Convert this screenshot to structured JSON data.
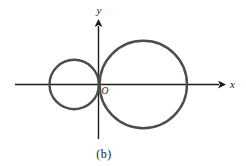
{
  "figure": {
    "caption": "(b)",
    "labels": {
      "x_axis": "x",
      "y_axis": "y",
      "origin": "O"
    },
    "colors": {
      "background": "#ffffff",
      "axis": "#1c1c1c",
      "circle_stroke": "#4d4d4d",
      "text": "#1c1c1c"
    },
    "geometry": {
      "x_axis": {
        "x1": 15,
        "y1": 84.5,
        "x2": 219,
        "y2": 84.5
      },
      "y_axis": {
        "x1": 98.5,
        "y1": 139,
        "x2": 98.5,
        "y2": 26
      },
      "axis_stroke_width": 1.4,
      "circle_stroke_width": 2.4,
      "circles": [
        {
          "name": "small-circle",
          "cx": 74.2,
          "cy": 84.5,
          "r": 24.7
        },
        {
          "name": "large-circle",
          "cx": 143.3,
          "cy": 84.5,
          "r": 43.7
        }
      ]
    }
  }
}
